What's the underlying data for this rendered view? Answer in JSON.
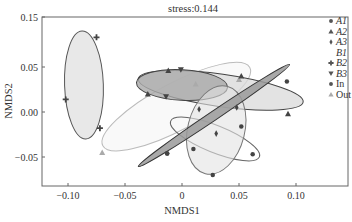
{
  "chart_data": {
    "type": "scatter",
    "title": "stress:0.144",
    "xlabel": "NMDS1",
    "ylabel": "NMDS2",
    "x_ticks": [
      {
        "label": "−0.10",
        "value": -0.1
      },
      {
        "label": "−0.05",
        "value": -0.05
      },
      {
        "label": "0",
        "value": 0
      },
      {
        "label": "0.05",
        "value": 0.05
      },
      {
        "label": "0.10",
        "value": 0.1
      }
    ],
    "y_ticks": [
      {
        "label": "0.15",
        "px": 17
      },
      {
        "label": "0.05",
        "px": 67
      },
      {
        "label": "0.00",
        "px": 112
      },
      {
        "label": "−0.05",
        "px": 157
      }
    ],
    "xlim": [
      -0.12,
      0.145
    ],
    "ylim": [
      -0.082,
      0.105
    ],
    "grid": false,
    "legend_position": "top-right inside",
    "legend": [
      {
        "label": "A1",
        "italic": true,
        "marker": "circle"
      },
      {
        "label": "A2",
        "italic": true,
        "marker": "triangle-up"
      },
      {
        "label": "A3",
        "italic": true,
        "marker": "diamond"
      },
      {
        "label": "B1",
        "italic": true,
        "marker": "none"
      },
      {
        "label": "B2",
        "italic": true,
        "marker": "plus"
      },
      {
        "label": "B3",
        "italic": true,
        "marker": "triangle-down"
      },
      {
        "label": "In",
        "italic": false,
        "marker": "circle"
      },
      {
        "label": "Out",
        "italic": false,
        "marker": "triangle-up"
      }
    ],
    "series": [
      {
        "name": "B2",
        "marker": "plus",
        "points": [
          [
            -0.075,
            0.083
          ],
          [
            -0.102,
            0.014
          ],
          [
            -0.072,
            -0.018
          ]
        ],
        "ellipse": {
          "cx": -0.086,
          "cy": 0.03,
          "rx": 0.017,
          "ry": 0.06,
          "angle": -2,
          "fill": "#e6e6e6",
          "stroke": "#555",
          "opacity": 0.9
        }
      },
      {
        "name": "Out",
        "marker": "triangle-up",
        "points": [
          [
            -0.07,
            -0.045
          ],
          [
            0.012,
            0.031
          ],
          [
            0.05,
            0.036
          ]
        ],
        "ellipse": {
          "cx": -0.005,
          "cy": 0.006,
          "rx": 0.073,
          "ry": 0.026,
          "angle": -28,
          "fill": "#f6f6f6",
          "stroke": "#bbb",
          "opacity": 0.7
        }
      },
      {
        "name": "A2",
        "marker": "triangle-up",
        "points": [
          [
            -0.012,
            0.046
          ],
          [
            0.052,
            0.04
          ],
          [
            0.093,
            -0.002
          ],
          [
            -0.03,
            0.02
          ]
        ],
        "ellipse": {
          "cx": 0.034,
          "cy": 0.024,
          "rx": 0.073,
          "ry": 0.018,
          "angle": 8,
          "fill": "#d9d9d9",
          "stroke": "#444",
          "opacity": 0.75
        }
      },
      {
        "name": "B3",
        "marker": "triangle-down",
        "points": [
          [
            -0.001,
            0.047
          ],
          [
            -0.014,
            0.017
          ]
        ],
        "ellipse": {
          "cx": 0.0,
          "cy": 0.03,
          "rx": 0.04,
          "ry": 0.017,
          "angle": 3,
          "fill": "#a9a9a9",
          "stroke": "#444",
          "opacity": 0.8
        }
      },
      {
        "name": "In",
        "marker": "circle",
        "points": [
          [
            -0.013,
            -0.046
          ],
          [
            0.01,
            -0.041
          ],
          [
            0.052,
            -0.016
          ],
          [
            0.062,
            -0.047
          ],
          [
            0.027,
            -0.07
          ]
        ],
        "ellipse": {
          "cx": 0.029,
          "cy": -0.03,
          "rx": 0.042,
          "ry": 0.015,
          "angle": 22,
          "fill": "none",
          "stroke": "#666",
          "opacity": 1
        }
      },
      {
        "name": "A3",
        "marker": "diamond",
        "points": [
          [
            0.015,
            0.003
          ],
          [
            0.03,
            -0.024
          ],
          [
            0.048,
            0.005
          ]
        ],
        "ellipse": {
          "cx": 0.03,
          "cy": -0.02,
          "rx": 0.025,
          "ry": 0.05,
          "angle": 14,
          "fill": "#e2e2e2",
          "stroke": "#777",
          "opacity": 0.6
        }
      },
      {
        "name": "A1",
        "marker": "circle",
        "points": [
          [
            -0.013,
            -0.046
          ],
          [
            0.092,
            0.034
          ]
        ],
        "ellipse": {
          "cx": 0.028,
          "cy": -0.004,
          "rx": 0.08,
          "ry": 0.005,
          "angle": -34,
          "fill": "#9a9a9a",
          "stroke": "#333",
          "opacity": 0.85
        }
      }
    ]
  }
}
